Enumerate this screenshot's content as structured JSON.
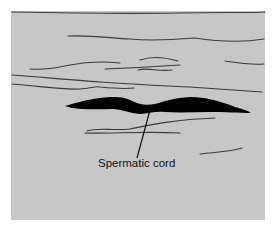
{
  "diagram": {
    "title": "",
    "background_color": "#c7c7c7",
    "structure_color": "#000000",
    "line_color": "#3a3a3a",
    "labels": [
      {
        "text": "Spermatic cord",
        "target": "dark-elongated-structure"
      }
    ]
  }
}
